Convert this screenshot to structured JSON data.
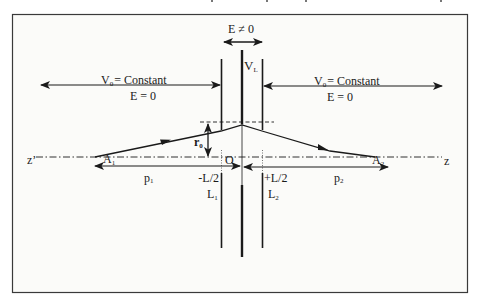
{
  "diagram": {
    "regions": {
      "left": {
        "potential_label": "V",
        "potential_sub": "0",
        "potential_value": "= Constant",
        "field_label": "E = 0"
      },
      "right": {
        "potential_label": "V",
        "potential_sub": "0",
        "potential_value": "= Constant",
        "field_label": "E = 0"
      },
      "center": {
        "field_label": "E ≠ 0"
      }
    },
    "electrodes": {
      "left": {
        "label": "L",
        "sub": "1",
        "position_label": "-L/2"
      },
      "center": {
        "label": "V",
        "sub": "L"
      },
      "right": {
        "label": "L",
        "sub": "2",
        "position_label": "+L/2"
      }
    },
    "axis": {
      "left_label": "z’",
      "right_label": "z",
      "origin_label": "O"
    },
    "points": {
      "object": {
        "label": "A",
        "sub": "1"
      },
      "image": {
        "label": "A",
        "sub": "2"
      }
    },
    "distances": {
      "object_distance": {
        "label": "p",
        "sub": "1"
      },
      "image_distance": {
        "label": "p",
        "sub": "2"
      },
      "ray_height": {
        "label": "r",
        "sub": "0"
      }
    },
    "colors": {
      "line": "#1a1a1a",
      "frame": "#3a3a3a",
      "background": "#fbfbf9"
    }
  }
}
